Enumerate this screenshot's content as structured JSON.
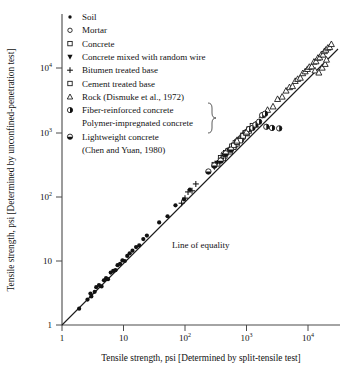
{
  "chart_data": {
    "type": "scatter",
    "title": "",
    "xlabel": "Tensile strength, psi [Determined by split-tensile test]",
    "ylabel": "Tensile strength, psi [Determined by unconfined-penetration test]",
    "xscale": "log",
    "yscale": "log",
    "xlim": [
      1,
      30000
    ],
    "ylim": [
      1,
      30000
    ],
    "grid": false,
    "xticks": [
      "1",
      "10",
      "10^2",
      "10^3",
      "10^4"
    ],
    "xtick_values": [
      1,
      10,
      100,
      1000,
      10000
    ],
    "yticks": [
      "1",
      "10",
      "10^2",
      "10^3",
      "10^4"
    ],
    "ytick_values": [
      1,
      10,
      100,
      1000,
      10000
    ],
    "legend_position": "upper-left",
    "annotations": [
      {
        "text": "Line of equality",
        "x": 60,
        "y": 26
      }
    ],
    "reference_line": {
      "name": "Line of equality",
      "label": "Line of equality",
      "from": [
        1,
        1
      ],
      "to": [
        30000,
        30000
      ],
      "slope": 1
    },
    "series": [
      {
        "name": "Soil",
        "marker": "filled-circle",
        "points": [
          [
            1.9,
            1.8
          ],
          [
            2.6,
            2.5
          ],
          [
            2.9,
            3.1
          ],
          [
            3.0,
            2.8
          ],
          [
            3.4,
            3.3
          ],
          [
            3.6,
            3.9
          ],
          [
            4.0,
            4.2
          ],
          [
            4.4,
            4.0
          ],
          [
            4.8,
            5.0
          ],
          [
            5.2,
            5.4
          ],
          [
            5.6,
            5.2
          ],
          [
            6.2,
            6.6
          ],
          [
            6.8,
            7.0
          ],
          [
            7.4,
            7.2
          ],
          [
            8.0,
            8.6
          ],
          [
            8.8,
            9.0
          ],
          [
            9.6,
            10.2
          ],
          [
            10.5,
            10.0
          ],
          [
            11.5,
            12.0
          ],
          [
            12.6,
            13.2
          ],
          [
            14.0,
            14.5
          ],
          [
            16.0,
            16.5
          ],
          [
            18.0,
            17.5
          ],
          [
            21.0,
            22.0
          ],
          [
            24.0,
            25.0
          ],
          [
            38.0,
            40.0
          ],
          [
            52.0,
            50.0
          ],
          [
            70.0,
            74.0
          ],
          [
            96.0,
            92.0
          ],
          [
            120.0,
            130.0
          ]
        ]
      },
      {
        "name": "Mortar",
        "marker": "open-circle",
        "points": [
          [
            380,
            400
          ],
          [
            420,
            470
          ],
          [
            450,
            430
          ],
          [
            500,
            540
          ],
          [
            560,
            580
          ],
          [
            600,
            640
          ],
          [
            650,
            620
          ],
          [
            700,
            760
          ],
          [
            760,
            800
          ],
          [
            820,
            870
          ],
          [
            880,
            840
          ],
          [
            940,
            980
          ],
          [
            1000,
            1060
          ]
        ]
      },
      {
        "name": "Concrete",
        "marker": "open-square",
        "points": [
          [
            300,
            320
          ],
          [
            340,
            330
          ],
          [
            380,
            410
          ],
          [
            420,
            400
          ],
          [
            460,
            490
          ],
          [
            500,
            520
          ],
          [
            540,
            510
          ],
          [
            580,
            620
          ],
          [
            620,
            600
          ],
          [
            660,
            700
          ],
          [
            700,
            680
          ],
          [
            760,
            790
          ],
          [
            820,
            800
          ],
          [
            880,
            920
          ],
          [
            950,
            1000
          ],
          [
            1020,
            980
          ],
          [
            1100,
            1150
          ]
        ]
      },
      {
        "name": "Concrete mixed with random wire",
        "marker": "filled-triangle-down",
        "points": [
          [
            300,
            290
          ],
          [
            330,
            340
          ],
          [
            360,
            350
          ],
          [
            400,
            380
          ],
          [
            430,
            450
          ],
          [
            470,
            460
          ],
          [
            520,
            530
          ],
          [
            560,
            540
          ],
          [
            610,
            640
          ]
        ]
      },
      {
        "name": "Bitumen treated base",
        "marker": "plus",
        "points": [
          [
            88,
            80
          ],
          [
            100,
            96
          ],
          [
            112,
            120
          ],
          [
            130,
            125
          ],
          [
            150,
            160
          ]
        ]
      },
      {
        "name": "Cement treated base",
        "marker": "open-square",
        "points": [
          [
            620,
            640
          ],
          [
            700,
            720
          ],
          [
            790,
            760
          ],
          [
            880,
            900
          ],
          [
            980,
            1000
          ],
          [
            1100,
            1080
          ],
          [
            1250,
            1300
          ]
        ]
      },
      {
        "name": "Rock (Dismuke et al., 1972)",
        "marker": "open-triangle-up",
        "points": [
          [
            700,
            760
          ],
          [
            1000,
            1050
          ],
          [
            1400,
            1350
          ],
          [
            1800,
            1900
          ],
          [
            2200,
            2300
          ],
          [
            2700,
            2600
          ],
          [
            3200,
            3400
          ],
          [
            3800,
            3700
          ],
          [
            4400,
            4600
          ],
          [
            5000,
            5200
          ],
          [
            5600,
            5400
          ],
          [
            6200,
            6500
          ],
          [
            6800,
            7000
          ],
          [
            7500,
            7300
          ],
          [
            8200,
            8600
          ],
          [
            9000,
            9200
          ],
          [
            9800,
            10000
          ],
          [
            10500,
            10800
          ],
          [
            11500,
            11000
          ],
          [
            12500,
            13000
          ],
          [
            13500,
            13200
          ],
          [
            14500,
            15000
          ],
          [
            15500,
            15200
          ],
          [
            16500,
            17000
          ],
          [
            17500,
            16800
          ],
          [
            18500,
            19000
          ],
          [
            19500,
            20000
          ],
          [
            21000,
            21500
          ],
          [
            22500,
            22000
          ],
          [
            24000,
            24500
          ],
          [
            13000,
            9500
          ],
          [
            15000,
            8800
          ],
          [
            17000,
            10500
          ],
          [
            19000,
            12000
          ],
          [
            20000,
            14000
          ]
        ]
      },
      {
        "name": "Fiber-reinforced concrete",
        "marker": "half-filled-circle-vertical",
        "points": [
          [
            1100,
            1150
          ],
          [
            1250,
            1200
          ],
          [
            1400,
            1350
          ],
          [
            1600,
            1500
          ],
          [
            2100,
            1250
          ],
          [
            2600,
            1200
          ],
          [
            3400,
            1180
          ]
        ]
      },
      {
        "name": "Polymer-impregnated concrete",
        "marker": "half-filled-circle-vertical",
        "points": [
          [
            1800,
            1900
          ],
          [
            2000,
            2000
          ]
        ]
      },
      {
        "name": "Lightweight concrete (Chen and Yuan, 1980)",
        "marker": "half-filled-circle-horizontal",
        "points": [
          [
            240,
            250
          ],
          [
            300,
            310
          ],
          [
            380,
            370
          ],
          [
            460,
            480
          ],
          [
            560,
            550
          ]
        ]
      }
    ]
  },
  "axes": {
    "x_title": "Tensile strength, psi [Determined by split-tensile test]",
    "y_title": "Tensile strength, psi [Determined by unconfined-penetration test]",
    "x_tick_labels": [
      {
        "base": "1",
        "exp": ""
      },
      {
        "base": "10",
        "exp": ""
      },
      {
        "base": "10",
        "exp": "2"
      },
      {
        "base": "10",
        "exp": "3"
      },
      {
        "base": "10",
        "exp": "4"
      }
    ],
    "y_tick_labels": [
      {
        "base": "1",
        "exp": ""
      },
      {
        "base": "10",
        "exp": ""
      },
      {
        "base": "10",
        "exp": "2"
      },
      {
        "base": "10",
        "exp": "3"
      },
      {
        "base": "10",
        "exp": "4"
      }
    ]
  },
  "legend": {
    "items": [
      {
        "marker": "filled-circle",
        "label": "Soil"
      },
      {
        "marker": "open-circle",
        "label": "Mortar"
      },
      {
        "marker": "open-square",
        "label": "Concrete"
      },
      {
        "marker": "filled-triangle-down",
        "label": "Concrete mixed with random wire"
      },
      {
        "marker": "plus",
        "label": "Bitumen treated base"
      },
      {
        "marker": "open-square",
        "label": "Cement treated base"
      },
      {
        "marker": "open-triangle-up",
        "label": "Rock (Dismuke et al., 1972)"
      },
      {
        "marker": "half-filled-circle-vertical",
        "label": "Fiber-reinforced concrete"
      },
      {
        "marker": "none",
        "label": "Polymer-impregnated concrete"
      },
      {
        "marker": "half-filled-circle-horizontal",
        "label": "Lightweight concrete"
      },
      {
        "marker": "none",
        "label": "(Chen and Yuan, 1980)"
      }
    ]
  },
  "annotation": {
    "line_of_equality": "Line of equality"
  },
  "colors": {
    "marker": "#111111",
    "axis": "#4a4a4a",
    "background": "#ffffff"
  }
}
